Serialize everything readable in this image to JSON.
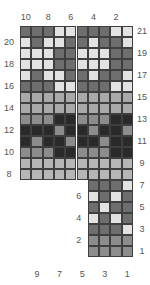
{
  "chart_data": {
    "type": "heatmap",
    "title": "",
    "palette": {
      "D": "#6e6e6e",
      "L": "#e2e2e2",
      "K": "#2a2a2a",
      "M": "#8c8c8c",
      "P": "#a9a9a9",
      "S": "#b6b6b6"
    },
    "columns_top_labels": [
      "10",
      "8",
      "6",
      "4",
      "2"
    ],
    "columns_bottom_labels": [
      "9",
      "7",
      "5",
      "3",
      "1"
    ],
    "rows_left_labels": [
      "20",
      "18",
      "16",
      "14",
      "12",
      "10",
      "8",
      "6",
      "4",
      "2"
    ],
    "rows_right_labels": [
      "21",
      "19",
      "17",
      "15",
      "13",
      "11",
      "9",
      "7",
      "5",
      "3",
      "1"
    ],
    "rows": [
      {
        "row": 21,
        "cols": "10-1",
        "cells": [
          "D",
          "D",
          "D",
          "L",
          "L",
          "D",
          "D",
          "D",
          "L",
          "L"
        ]
      },
      {
        "row": 20,
        "cols": "10-1",
        "cells": [
          "L",
          "D",
          "L",
          "L",
          "D",
          "D",
          "L",
          "D",
          "D",
          "L"
        ]
      },
      {
        "row": 19,
        "cols": "10-1",
        "cells": [
          "L",
          "L",
          "L",
          "D",
          "D",
          "L",
          "L",
          "L",
          "D",
          "D"
        ]
      },
      {
        "row": 18,
        "cols": "10-1",
        "cells": [
          "L",
          "L",
          "L",
          "D",
          "D",
          "L",
          "L",
          "L",
          "D",
          "D"
        ]
      },
      {
        "row": 17,
        "cols": "10-1",
        "cells": [
          "L",
          "D",
          "L",
          "L",
          "D",
          "D",
          "L",
          "D",
          "D",
          "L"
        ]
      },
      {
        "row": 16,
        "cols": "10-1",
        "cells": [
          "D",
          "D",
          "D",
          "L",
          "L",
          "D",
          "D",
          "D",
          "L",
          "L"
        ]
      },
      {
        "row": 15,
        "cols": "10-1",
        "cells": [
          "P",
          "P",
          "P",
          "P",
          "P",
          "P",
          "P",
          "P",
          "P",
          "P"
        ]
      },
      {
        "row": 14,
        "cols": "10-1",
        "cells": [
          "P",
          "P",
          "P",
          "P",
          "P",
          "P",
          "P",
          "P",
          "P",
          "P"
        ]
      },
      {
        "row": 13,
        "cols": "10-1",
        "cells": [
          "M",
          "M",
          "M",
          "K",
          "K",
          "M",
          "M",
          "M",
          "K",
          "K"
        ]
      },
      {
        "row": 12,
        "cols": "10-1",
        "cells": [
          "K",
          "K",
          "K",
          "M",
          "K",
          "K",
          "M",
          "K",
          "K",
          "M"
        ]
      },
      {
        "row": 11,
        "cols": "10-1",
        "cells": [
          "K",
          "M",
          "K",
          "K",
          "M",
          "K",
          "K",
          "M",
          "K",
          "K"
        ]
      },
      {
        "row": 10,
        "cols": "10-1",
        "cells": [
          "M",
          "M",
          "M",
          "K",
          "K",
          "M",
          "M",
          "M",
          "K",
          "K"
        ]
      },
      {
        "row": 9,
        "cols": "10-1",
        "cells": [
          "S",
          "S",
          "S",
          "S",
          "S",
          "S",
          "S",
          "S",
          "S",
          "S"
        ]
      },
      {
        "row": 8,
        "cols": "10-1",
        "cells": [
          "S",
          "S",
          "S",
          "S",
          "S",
          "S",
          "S",
          "S",
          "S",
          "S"
        ]
      },
      {
        "row": 7,
        "cols": "4-1",
        "cells": [
          "D",
          "D",
          "D",
          "L"
        ]
      },
      {
        "row": 6,
        "cols": "4-1",
        "cells": [
          "L",
          "D",
          "L",
          "D"
        ]
      },
      {
        "row": 5,
        "cols": "4-1",
        "cells": [
          "D",
          "L",
          "D",
          "D"
        ]
      },
      {
        "row": 4,
        "cols": "4-1",
        "cells": [
          "L",
          "D",
          "L",
          "D"
        ]
      },
      {
        "row": 3,
        "cols": "4-1",
        "cells": [
          "D",
          "D",
          "D",
          "L"
        ]
      },
      {
        "row": 2,
        "cols": "4-1",
        "cells": [
          "M",
          "M",
          "M",
          "M"
        ]
      },
      {
        "row": 1,
        "cols": "4-1",
        "cells": [
          "M",
          "M",
          "M",
          "M"
        ]
      }
    ],
    "legend": [],
    "grid": true
  }
}
